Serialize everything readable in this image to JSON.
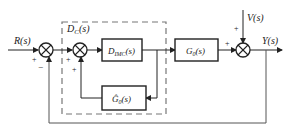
{
  "diagram": {
    "type": "block-diagram",
    "inputs": {
      "reference": "R(s)",
      "disturbance": "V(s)"
    },
    "output": "Y(s)",
    "controller_group_label": "D_C(s)",
    "blocks": [
      {
        "id": "dimc",
        "label_main": "D",
        "label_sub": "IMC",
        "label_arg": "(s)"
      },
      {
        "id": "g0",
        "label_main": "G",
        "label_sub": "0",
        "label_arg": "(s)"
      },
      {
        "id": "g0hat",
        "label_main": "Ĝ",
        "label_sub": "0",
        "label_arg": "(s)"
      }
    ],
    "summing_junctions": [
      {
        "id": "sum1",
        "signs": {
          "left": "+",
          "bottom": "−"
        }
      },
      {
        "id": "sum2",
        "signs": {
          "left": "+",
          "bottom": "+"
        }
      },
      {
        "id": "sum3",
        "signs": {
          "left": "+",
          "top": "+"
        }
      }
    ],
    "dc_label_main": "D",
    "dc_label_sub": "C",
    "dc_label_arg": "(s)",
    "colors": {
      "line": "#222222",
      "dashed": "#777777",
      "feedback": "#555555"
    }
  }
}
